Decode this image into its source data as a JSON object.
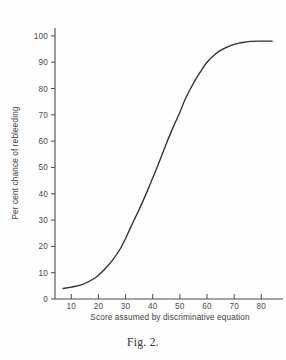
{
  "figure": {
    "caption": "Fig. 2."
  },
  "chart_data": {
    "type": "line",
    "title": "",
    "subtitle": "",
    "xlabel": "Score assumed by discriminative equation",
    "ylabel": "Per cent chance of rebleeding",
    "xlim": [
      4,
      88
    ],
    "ylim": [
      0,
      103
    ],
    "xticks": [
      10,
      20,
      30,
      40,
      50,
      60,
      70,
      80
    ],
    "xtick_labels": [
      "10",
      "20",
      "30",
      "40",
      "50",
      "60",
      "70",
      "80"
    ],
    "yticks": [
      0,
      10,
      20,
      30,
      40,
      50,
      60,
      70,
      80,
      90,
      100
    ],
    "ytick_labels": [
      "0",
      "10",
      "20",
      "30",
      "40",
      "50",
      "60",
      "70",
      "80",
      "90",
      "100"
    ],
    "grid": false,
    "legend": false,
    "legend_position": "none",
    "annotations": [],
    "series": [
      {
        "name": "Per cent chance of rebleeding",
        "color": "#2e2e2e",
        "x": [
          7,
          10,
          14,
          18,
          20,
          22,
          25,
          28,
          30,
          32,
          35,
          38,
          40,
          42,
          45,
          47,
          50,
          52,
          55,
          58,
          60,
          63,
          65,
          68,
          70,
          73,
          76,
          80,
          84
        ],
        "y": [
          4,
          4.5,
          5.5,
          7.5,
          9,
          11,
          14.5,
          19,
          23,
          27.5,
          34,
          41,
          46,
          51,
          59,
          64,
          71,
          76,
          82,
          87,
          90,
          93,
          94.5,
          96,
          96.8,
          97.5,
          97.9,
          98,
          98
        ]
      }
    ]
  },
  "axes": {
    "y_axis_name": "y-axis",
    "x_axis_name": "x-axis"
  }
}
